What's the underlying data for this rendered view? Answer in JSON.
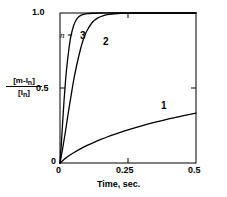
{
  "chart_data": {
    "type": "line",
    "title": "",
    "subtitle": "",
    "xlabel": "Time, sec.",
    "ylabel_numerator": "[m-I",
    "ylabel_numerator_sub": "n",
    "ylabel_numerator_end": "]",
    "ylabel_denominator": "[I",
    "ylabel_denominator_sub": "n",
    "ylabel_denominator_end": "]",
    "xlim": [
      0,
      0.5
    ],
    "ylim": [
      0,
      1.0
    ],
    "xticks": [
      0,
      0.25,
      0.5
    ],
    "xticklabels": [
      "0",
      "0.25",
      "0.5"
    ],
    "yticks": [
      0,
      0.5,
      1.0
    ],
    "yticklabels": [
      "0",
      "0.5",
      "1.0"
    ],
    "grid": false,
    "legend_position": "inline-annotations",
    "annotation_n": "n =",
    "series": [
      {
        "name": "1",
        "label": "1",
        "x": [
          0,
          0.025,
          0.05,
          0.075,
          0.1,
          0.125,
          0.15,
          0.175,
          0.2,
          0.25,
          0.3,
          0.35,
          0.4,
          0.45,
          0.5
        ],
        "values": [
          0,
          0.038,
          0.068,
          0.094,
          0.117,
          0.138,
          0.157,
          0.175,
          0.191,
          0.221,
          0.248,
          0.272,
          0.294,
          0.314,
          0.333
        ]
      },
      {
        "name": "2",
        "label": "2",
        "x": [
          0,
          0.01,
          0.02,
          0.03,
          0.04,
          0.05,
          0.06,
          0.07,
          0.08,
          0.09,
          0.1,
          0.12,
          0.14,
          0.16,
          0.18,
          0.2,
          0.25,
          0.3,
          0.4,
          0.5
        ],
        "values": [
          0,
          0.1,
          0.21,
          0.33,
          0.44,
          0.55,
          0.64,
          0.72,
          0.79,
          0.845,
          0.885,
          0.94,
          0.968,
          0.983,
          0.991,
          0.995,
          0.999,
          1.0,
          1.0,
          1.0
        ]
      },
      {
        "name": "3",
        "label": "3",
        "x": [
          0,
          0.005,
          0.01,
          0.015,
          0.02,
          0.025,
          0.03,
          0.035,
          0.04,
          0.05,
          0.06,
          0.07,
          0.08,
          0.1,
          0.15,
          0.2,
          0.3,
          0.4,
          0.5
        ],
        "values": [
          0,
          0.13,
          0.28,
          0.42,
          0.54,
          0.64,
          0.72,
          0.79,
          0.845,
          0.915,
          0.955,
          0.976,
          0.987,
          0.996,
          1.0,
          1.0,
          1.0,
          1.0,
          1.0
        ]
      }
    ]
  },
  "axis": {
    "y_top_label": "1.0",
    "y_mid_label": "0.5",
    "y_zero_label": "0",
    "x_zero_label": "0",
    "x_mid_label": "0.25",
    "x_max_label": "0.5",
    "x_title": "Time, sec.",
    "n_annotation": "n ="
  },
  "curve_labels": {
    "one": "1",
    "two": "2",
    "three": "3"
  },
  "colors": {
    "line": "#000000",
    "frame": "#000000",
    "background": "#ffffff"
  }
}
